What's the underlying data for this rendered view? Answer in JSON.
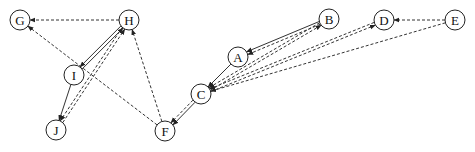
{
  "diagram": {
    "type": "directed-graph",
    "nodes": [
      {
        "id": "A",
        "label": "A",
        "x": 238,
        "y": 57
      },
      {
        "id": "B",
        "label": "B",
        "x": 329,
        "y": 19
      },
      {
        "id": "C",
        "label": "C",
        "x": 201,
        "y": 94
      },
      {
        "id": "D",
        "label": "D",
        "x": 384,
        "y": 20
      },
      {
        "id": "E",
        "label": "E",
        "x": 455,
        "y": 20
      },
      {
        "id": "F",
        "label": "F",
        "x": 165,
        "y": 131
      },
      {
        "id": "G",
        "label": "G",
        "x": 20,
        "y": 20
      },
      {
        "id": "H",
        "label": "H",
        "x": 129,
        "y": 20
      },
      {
        "id": "I",
        "label": "I",
        "x": 74,
        "y": 75
      },
      {
        "id": "J",
        "label": "J",
        "x": 56,
        "y": 130
      }
    ],
    "edges": [
      {
        "from": "B",
        "to": "A",
        "style": "solid"
      },
      {
        "from": "B",
        "to": "A",
        "style": "dashed"
      },
      {
        "from": "A",
        "to": "C",
        "style": "solid"
      },
      {
        "from": "C",
        "to": "B",
        "style": "dashed"
      },
      {
        "from": "B",
        "to": "C",
        "style": "dashed"
      },
      {
        "from": "D",
        "to": "C",
        "style": "dashed"
      },
      {
        "from": "C",
        "to": "D",
        "style": "dashed"
      },
      {
        "from": "E",
        "to": "C",
        "style": "dashed"
      },
      {
        "from": "E",
        "to": "D",
        "style": "dashed"
      },
      {
        "from": "C",
        "to": "F",
        "style": "solid"
      },
      {
        "from": "C",
        "to": "F",
        "style": "dashed"
      },
      {
        "from": "F",
        "to": "H",
        "style": "dashed"
      },
      {
        "from": "F",
        "to": "G",
        "style": "dashed"
      },
      {
        "from": "H",
        "to": "G",
        "style": "dashed"
      },
      {
        "from": "I",
        "to": "H",
        "style": "solid"
      },
      {
        "from": "H",
        "to": "I",
        "style": "solid"
      },
      {
        "from": "I",
        "to": "J",
        "style": "solid"
      },
      {
        "from": "J",
        "to": "H",
        "style": "dashed"
      },
      {
        "from": "H",
        "to": "J",
        "style": "dashed"
      }
    ],
    "node_radius": 10,
    "colors": {
      "stroke": "#333333",
      "background": "#ffffff"
    }
  }
}
